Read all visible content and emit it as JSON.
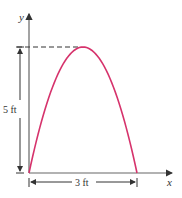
{
  "diagram": {
    "axis_labels": {
      "x": "x",
      "y": "y"
    },
    "height_label": "5 ft",
    "width_label": "3 ft",
    "curve_color": "#d6336c",
    "axis_color": "#555555",
    "chart_data": {
      "type": "line",
      "description": "parabolic arch",
      "height_ft": 5,
      "width_ft": 3,
      "points": [
        [
          0,
          0
        ],
        [
          1.5,
          5
        ],
        [
          3,
          0
        ]
      ]
    }
  }
}
